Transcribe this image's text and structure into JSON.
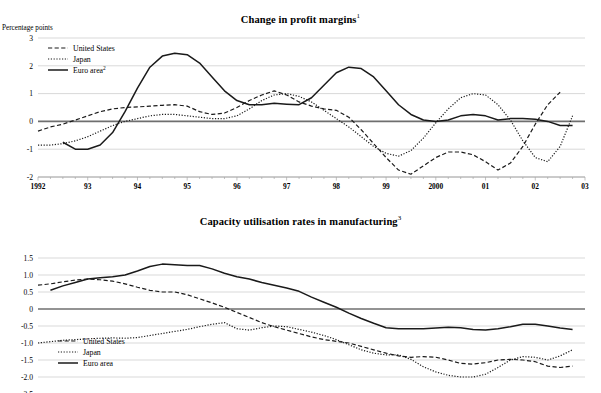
{
  "document": {
    "top_partial_title": "",
    "footnote_markers": [
      "1",
      "2",
      "3"
    ]
  },
  "colors": {
    "line": "#1a1a1a",
    "gridline": "#c9c9c9",
    "zeroline": "#6f6f6f",
    "background": "#ffffff"
  },
  "panels": [
    {
      "id": "profit-margins",
      "title": "Change in profit margins",
      "title_superscript": "1",
      "axis_unit_label": "Percentage points"
    },
    {
      "id": "capacity-utilisation",
      "title": "Capacity utilisation rates in manufacturing",
      "title_superscript": "3",
      "axis_unit_label": ""
    }
  ],
  "chart_data": [
    {
      "type": "line",
      "title": "Change in profit margins",
      "title_superscript": "1",
      "xlabel": "",
      "ylabel": "Percentage points",
      "ylim": [
        -2,
        3
      ],
      "yticks": [
        3,
        2,
        1,
        0,
        -1,
        -2
      ],
      "ytick_labels": [
        "3",
        "2",
        "1",
        "0",
        "-1",
        "-2"
      ],
      "xlim": [
        1992.0,
        2003.0
      ],
      "xticks": [
        1992,
        1993,
        1994,
        1995,
        1996,
        1997,
        1998,
        1999,
        2000,
        2001,
        2002,
        2003
      ],
      "xtick_labels": [
        "1992",
        "93",
        "94",
        "95",
        "96",
        "97",
        "98",
        "99",
        "2000",
        "01",
        "02",
        "03"
      ],
      "grid": true,
      "minor_ticks_per_year": 4,
      "legend_position": "top-left",
      "series": [
        {
          "name": "United States",
          "style": "dashed",
          "x": [
            1992.0,
            1992.25,
            1992.5,
            1992.75,
            1993.0,
            1993.25,
            1993.5,
            1993.75,
            1994.0,
            1994.25,
            1994.5,
            1994.75,
            1995.0,
            1995.25,
            1995.5,
            1995.75,
            1996.0,
            1996.25,
            1996.5,
            1996.75,
            1997.0,
            1997.25,
            1997.5,
            1997.75,
            1998.0,
            1998.25,
            1998.5,
            1998.75,
            1999.0,
            1999.25,
            1999.5,
            1999.75,
            2000.0,
            2000.25,
            2000.5,
            2000.75,
            2001.0,
            2001.25,
            2001.5,
            2001.75,
            2002.0,
            2002.25,
            2002.5
          ],
          "values": [
            -0.35,
            -0.2,
            -0.1,
            0.05,
            0.2,
            0.35,
            0.45,
            0.5,
            0.52,
            0.55,
            0.58,
            0.6,
            0.55,
            0.35,
            0.25,
            0.3,
            0.5,
            0.75,
            0.95,
            1.1,
            0.95,
            0.7,
            0.55,
            0.45,
            0.4,
            0.15,
            -0.3,
            -0.8,
            -1.3,
            -1.75,
            -1.9,
            -1.6,
            -1.3,
            -1.1,
            -1.1,
            -1.2,
            -1.45,
            -1.75,
            -1.5,
            -0.9,
            -0.1,
            0.6,
            1.05
          ]
        },
        {
          "name": "Japan",
          "style": "dotted",
          "x": [
            1992.0,
            1992.25,
            1992.5,
            1992.75,
            1993.0,
            1993.25,
            1993.5,
            1993.75,
            1994.0,
            1994.25,
            1994.5,
            1994.75,
            1995.0,
            1995.25,
            1995.5,
            1995.75,
            1996.0,
            1996.25,
            1996.5,
            1996.75,
            1997.0,
            1997.25,
            1997.5,
            1997.75,
            1998.0,
            1998.25,
            1998.5,
            1998.75,
            1999.0,
            1999.25,
            1999.5,
            1999.75,
            2000.0,
            2000.25,
            2000.5,
            2000.75,
            2001.0,
            2001.25,
            2001.5,
            2001.75,
            2002.0,
            2002.25,
            2002.5,
            2002.75
          ],
          "values": [
            -0.85,
            -0.85,
            -0.8,
            -0.7,
            -0.55,
            -0.35,
            -0.15,
            0.0,
            0.1,
            0.2,
            0.25,
            0.25,
            0.2,
            0.15,
            0.1,
            0.1,
            0.2,
            0.45,
            0.75,
            0.95,
            1.0,
            0.9,
            0.7,
            0.4,
            0.1,
            -0.2,
            -0.55,
            -0.9,
            -1.15,
            -1.25,
            -1.05,
            -0.6,
            -0.05,
            0.45,
            0.85,
            1.0,
            0.95,
            0.6,
            0.05,
            -0.7,
            -1.3,
            -1.45,
            -0.9,
            0.2
          ]
        },
        {
          "name": "Euro area",
          "name_superscript": "2",
          "style": "solid",
          "x": [
            1992.5,
            1992.75,
            1993.0,
            1993.25,
            1993.5,
            1993.75,
            1994.0,
            1994.25,
            1994.5,
            1994.75,
            1995.0,
            1995.25,
            1995.5,
            1995.75,
            1996.0,
            1996.25,
            1996.5,
            1996.75,
            1997.0,
            1997.25,
            1997.5,
            1997.75,
            1998.0,
            1998.25,
            1998.5,
            1998.75,
            1999.0,
            1999.25,
            1999.5,
            1999.75,
            2000.0,
            2000.25,
            2000.5,
            2000.75,
            2001.0,
            2001.25,
            2001.5,
            2001.75,
            2002.0,
            2002.25,
            2002.5,
            2002.75
          ],
          "values": [
            -0.75,
            -1.0,
            -1.0,
            -0.85,
            -0.4,
            0.35,
            1.2,
            1.95,
            2.35,
            2.45,
            2.4,
            2.1,
            1.6,
            1.1,
            0.75,
            0.6,
            0.6,
            0.65,
            0.62,
            0.6,
            0.85,
            1.3,
            1.75,
            1.95,
            1.9,
            1.6,
            1.1,
            0.6,
            0.25,
            0.05,
            0.0,
            0.05,
            0.2,
            0.25,
            0.2,
            0.05,
            0.1,
            0.1,
            0.08,
            0.0,
            -0.15,
            -0.15
          ]
        }
      ]
    },
    {
      "type": "line",
      "title": "Capacity utilisation rates in manufacturing",
      "title_superscript": "3",
      "xlabel": "",
      "ylabel": "",
      "ylim": [
        -2.5,
        1.5
      ],
      "yticks": [
        1.5,
        1.0,
        0.5,
        0,
        -0.5,
        -1.0,
        -1.5,
        -2.0,
        -2.5
      ],
      "ytick_labels": [
        "1.5",
        "1.0",
        "0.5",
        "0",
        "-0.5",
        "-1.0",
        "-1.5",
        "-2.0",
        "-2.5"
      ],
      "xlim": [
        1992.0,
        2003.0
      ],
      "xticks": [
        1992,
        1993,
        1994,
        1995,
        1996,
        1997,
        1998,
        1999,
        2000,
        2001,
        2002,
        2003
      ],
      "xtick_labels": [
        "",
        "",
        "",
        "",
        "",
        "",
        "",
        "",
        "",
        "",
        "",
        ""
      ],
      "grid": true,
      "minor_ticks_per_year": 4,
      "legend_position": "lower-left",
      "series": [
        {
          "name": "United States",
          "style": "dashed",
          "x": [
            1992.0,
            1992.25,
            1992.5,
            1992.75,
            1993.0,
            1993.25,
            1993.5,
            1993.75,
            1994.0,
            1994.25,
            1994.5,
            1994.75,
            1995.0,
            1995.25,
            1995.5,
            1995.75,
            1996.0,
            1996.25,
            1996.5,
            1996.75,
            1997.0,
            1997.25,
            1997.5,
            1997.75,
            1998.0,
            1998.25,
            1998.5,
            1998.75,
            1999.0,
            1999.25,
            1999.5,
            1999.75,
            2000.0,
            2000.25,
            2000.5,
            2000.75,
            2001.0,
            2001.25,
            2001.5,
            2001.75,
            2002.0,
            2002.25,
            2002.5,
            2002.75
          ],
          "values": [
            0.7,
            0.74,
            0.8,
            0.85,
            0.88,
            0.86,
            0.82,
            0.74,
            0.64,
            0.55,
            0.5,
            0.5,
            0.42,
            0.3,
            0.18,
            0.05,
            -0.1,
            -0.25,
            -0.4,
            -0.52,
            -0.62,
            -0.72,
            -0.82,
            -0.9,
            -0.95,
            -1.0,
            -1.1,
            -1.2,
            -1.3,
            -1.38,
            -1.42,
            -1.4,
            -1.42,
            -1.5,
            -1.6,
            -1.62,
            -1.58,
            -1.5,
            -1.48,
            -1.5,
            -1.55,
            -1.68,
            -1.72,
            -1.68
          ]
        },
        {
          "name": "Japan",
          "style": "dotted",
          "x": [
            1992.0,
            1992.25,
            1992.5,
            1992.75,
            1993.0,
            1993.25,
            1993.5,
            1993.75,
            1994.0,
            1994.25,
            1994.5,
            1994.75,
            1995.0,
            1995.25,
            1995.5,
            1995.75,
            1996.0,
            1996.25,
            1996.5,
            1996.75,
            1997.0,
            1997.25,
            1997.5,
            1997.75,
            1998.0,
            1998.25,
            1998.5,
            1998.75,
            1999.0,
            1999.25,
            1999.5,
            1999.75,
            2000.0,
            2000.25,
            2000.5,
            2000.75,
            2001.0,
            2001.25,
            2001.5,
            2001.75,
            2002.0,
            2002.25,
            2002.5,
            2002.75
          ],
          "values": [
            -1.0,
            -0.96,
            -0.92,
            -0.9,
            -0.88,
            -0.86,
            -0.85,
            -0.86,
            -0.84,
            -0.78,
            -0.72,
            -0.66,
            -0.6,
            -0.52,
            -0.45,
            -0.4,
            -0.58,
            -0.62,
            -0.55,
            -0.5,
            -0.52,
            -0.6,
            -0.68,
            -0.78,
            -0.9,
            -1.05,
            -1.2,
            -1.3,
            -1.35,
            -1.35,
            -1.48,
            -1.7,
            -1.85,
            -1.95,
            -2.0,
            -2.0,
            -1.92,
            -1.72,
            -1.5,
            -1.4,
            -1.42,
            -1.5,
            -1.38,
            -1.2
          ]
        },
        {
          "name": "Euro area",
          "style": "solid",
          "x": [
            1992.25,
            1992.5,
            1992.75,
            1993.0,
            1993.25,
            1993.5,
            1993.75,
            1994.0,
            1994.25,
            1994.5,
            1994.75,
            1995.0,
            1995.25,
            1995.5,
            1995.75,
            1996.0,
            1996.25,
            1996.5,
            1996.75,
            1997.0,
            1997.25,
            1997.5,
            1997.75,
            1998.0,
            1998.25,
            1998.5,
            1998.75,
            1999.0,
            1999.25,
            1999.5,
            1999.75,
            2000.0,
            2000.25,
            2000.5,
            2000.75,
            2001.0,
            2001.25,
            2001.5,
            2001.75,
            2002.0,
            2002.25,
            2002.5,
            2002.75
          ],
          "values": [
            0.55,
            0.68,
            0.78,
            0.88,
            0.92,
            0.95,
            1.0,
            1.12,
            1.25,
            1.32,
            1.3,
            1.28,
            1.28,
            1.18,
            1.05,
            0.95,
            0.88,
            0.78,
            0.7,
            0.62,
            0.52,
            0.35,
            0.2,
            0.05,
            -0.12,
            -0.28,
            -0.42,
            -0.55,
            -0.58,
            -0.58,
            -0.58,
            -0.56,
            -0.54,
            -0.55,
            -0.6,
            -0.62,
            -0.58,
            -0.52,
            -0.45,
            -0.45,
            -0.5,
            -0.56,
            -0.6
          ]
        }
      ]
    }
  ]
}
